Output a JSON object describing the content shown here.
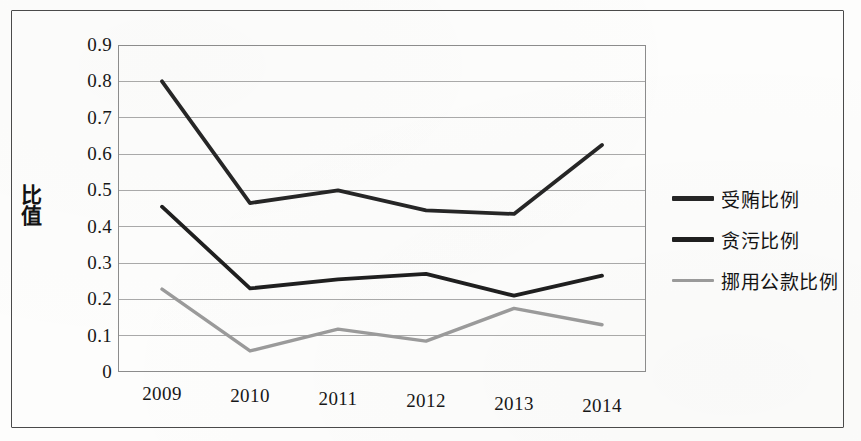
{
  "chart_data": {
    "type": "line",
    "title": "",
    "xlabel": "",
    "ylabel": "比值",
    "categories": [
      "2009",
      "2010",
      "2011",
      "2012",
      "2013",
      "2014"
    ],
    "ylim": [
      0,
      0.9
    ],
    "ytick_labels": [
      "0.9",
      "0.8",
      "0.7",
      "0.6",
      "0.5",
      "0.4",
      "0.3",
      "0.2",
      "0.1",
      "0"
    ],
    "ytick_values": [
      0.9,
      0.8,
      0.7,
      0.6,
      0.5,
      0.4,
      0.3,
      0.2,
      0.1,
      0
    ],
    "grid": true,
    "legend_position": "right",
    "series": [
      {
        "name": "受贿比例",
        "color": "#262626",
        "values": [
          0.8,
          0.465,
          0.5,
          0.445,
          0.435,
          0.625
        ]
      },
      {
        "name": "贪污比例",
        "color": "#1f1f1f",
        "values": [
          0.455,
          0.23,
          0.255,
          0.27,
          0.21,
          0.265
        ]
      },
      {
        "name": "挪用公款比例",
        "color": "#9a9a9a",
        "values": [
          0.228,
          0.058,
          0.118,
          0.085,
          0.175,
          0.13
        ]
      }
    ]
  },
  "axis": {
    "y_label": "比值"
  },
  "legend": {
    "items": [
      {
        "label": "受贿比例",
        "color": "#262626"
      },
      {
        "label": "贪污比例",
        "color": "#1f1f1f"
      },
      {
        "label": "挪用公款比例",
        "color": "#9a9a9a"
      }
    ]
  },
  "colors": {
    "grid": "#9a9a9a",
    "frame": "#4a4a4a",
    "text": "#171717",
    "background": "#fdfdfc"
  }
}
